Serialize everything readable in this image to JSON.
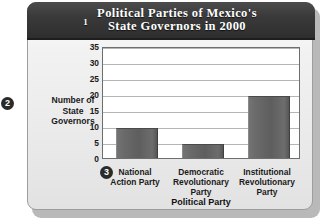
{
  "figure": {
    "title": "Political Parties of Mexico's\nState Governors in 2000",
    "callouts": {
      "one": "1",
      "two": "2",
      "three": "3"
    }
  },
  "chart_data": {
    "type": "bar",
    "title": "Political Parties of Mexico's State Governors in 2000",
    "xlabel": "Political Party",
    "ylabel": "Number of\nState\nGovernors",
    "categories": [
      "National\nAction Party",
      "Democratic\nRevolutionary\nParty",
      "Institutional\nRevolutionary\nParty"
    ],
    "values": [
      9,
      4,
      19
    ],
    "ylim": [
      0,
      35
    ],
    "yticks": [
      0,
      5,
      10,
      15,
      20,
      25,
      30,
      35
    ],
    "ytick_labels": [
      "0",
      "5",
      "10",
      "15",
      "20",
      "25",
      "30",
      "35"
    ],
    "grid": true,
    "legend": false,
    "bar_color": "#646464",
    "plot_background": "#ffffff",
    "panel_background": "#ebebeb",
    "banner_color": "#333333"
  }
}
